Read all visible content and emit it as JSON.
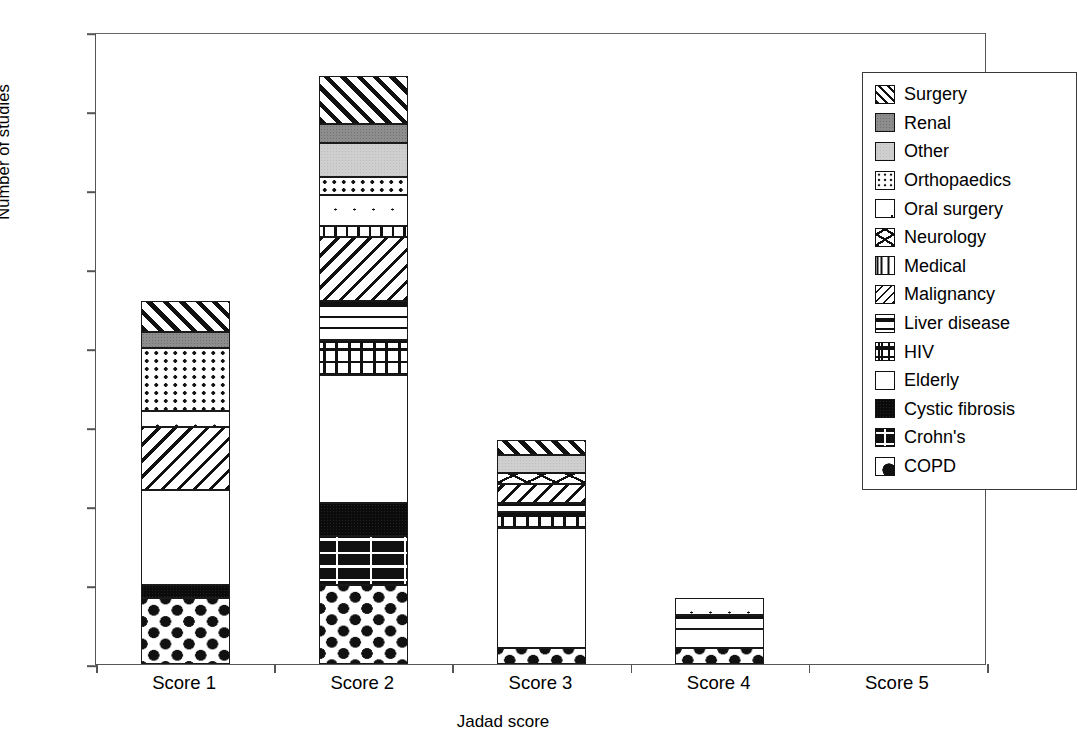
{
  "chart_data": {
    "type": "bar",
    "subtype": "stacked-bar",
    "title": "",
    "xlabel": "Jadad score",
    "ylabel": "Number of studies",
    "categories": [
      "Score 1",
      "Score 2",
      "Score 3",
      "Score 4",
      "Score 5"
    ],
    "ylim": [
      0,
      40
    ],
    "yticks": [
      0,
      5,
      10,
      15,
      20,
      25,
      30,
      35,
      40
    ],
    "grid": false,
    "legend_position": "top-right (inside plot area)",
    "series": [
      {
        "name": "COPD",
        "values": [
          4.2,
          5.0,
          1.0,
          1.0,
          0
        ]
      },
      {
        "name": "Crohn's",
        "values": [
          0,
          3.1,
          0,
          0,
          0
        ]
      },
      {
        "name": "Cystic fibrosis",
        "values": [
          0.8,
          2.1,
          0,
          0,
          0
        ]
      },
      {
        "name": "Elderly",
        "values": [
          6.0,
          8.1,
          7.6,
          1.2,
          0
        ]
      },
      {
        "name": "HIV",
        "values": [
          0,
          2.2,
          1.0,
          0,
          0
        ]
      },
      {
        "name": "Liver disease",
        "values": [
          0,
          2.5,
          0.6,
          0.9,
          0
        ]
      },
      {
        "name": "Malignancy",
        "values": [
          4.0,
          4.0,
          1.2,
          0,
          0
        ]
      },
      {
        "name": "Medical",
        "values": [
          0,
          0.7,
          0,
          0,
          0
        ]
      },
      {
        "name": "Neurology",
        "values": [
          0,
          0,
          0.7,
          0,
          0
        ]
      },
      {
        "name": "Oral surgery",
        "values": [
          1.0,
          2.0,
          0,
          1.1,
          0
        ]
      },
      {
        "name": "Orthopaedics",
        "values": [
          4.0,
          1.1,
          0,
          0,
          0
        ]
      },
      {
        "name": "Other",
        "values": [
          0,
          2.2,
          1.1,
          0,
          0
        ]
      },
      {
        "name": "Renal",
        "values": [
          1.0,
          1.2,
          0,
          0,
          0
        ]
      },
      {
        "name": "Surgery",
        "values": [
          2.0,
          3.0,
          1.0,
          0,
          0
        ]
      }
    ],
    "totals": [
      23.0,
      37.2,
      14.2,
      4.2,
      0
    ],
    "stacks": [
      {
        "category": "Score 1",
        "total": "23",
        "segments": [
          {
            "name": "COPD",
            "from": 0,
            "to": 4.2
          },
          {
            "name": "Cystic fibrosis",
            "from": 4.2,
            "to": 5.0
          },
          {
            "name": "Elderly",
            "from": 5.0,
            "to": 11.0
          },
          {
            "name": "Malignancy",
            "from": 11.0,
            "to": 15.0
          },
          {
            "name": "Oral surgery",
            "from": 15.0,
            "to": 16.0
          },
          {
            "name": "Orthopaedics",
            "from": 16.0,
            "to": 20.0
          },
          {
            "name": "Renal",
            "from": 20.0,
            "to": 21.0
          },
          {
            "name": "Surgery",
            "from": 21.0,
            "to": 23.0
          }
        ]
      },
      {
        "category": "Score 2",
        "total": "37",
        "segments": [
          {
            "name": "COPD",
            "from": 0,
            "to": 5.0
          },
          {
            "name": "Crohn's",
            "from": 5.0,
            "to": 8.1
          },
          {
            "name": "Cystic fibrosis",
            "from": 8.1,
            "to": 10.2
          },
          {
            "name": "Elderly",
            "from": 10.2,
            "to": 18.3
          },
          {
            "name": "HIV",
            "from": 18.3,
            "to": 20.5
          },
          {
            "name": "Liver disease",
            "from": 20.5,
            "to": 23.0
          },
          {
            "name": "Malignancy",
            "from": 23.0,
            "to": 27.0
          },
          {
            "name": "Medical",
            "from": 27.0,
            "to": 27.7
          },
          {
            "name": "Oral surgery",
            "from": 27.7,
            "to": 29.7
          },
          {
            "name": "Orthopaedics",
            "from": 29.7,
            "to": 30.8
          },
          {
            "name": "Other",
            "from": 30.8,
            "to": 33.0
          },
          {
            "name": "Renal",
            "from": 33.0,
            "to": 34.2
          },
          {
            "name": "Surgery",
            "from": 34.2,
            "to": 37.2
          }
        ]
      },
      {
        "category": "Score 3",
        "total": "14",
        "segments": [
          {
            "name": "COPD",
            "from": 0,
            "to": 1.0
          },
          {
            "name": "Elderly",
            "from": 1.0,
            "to": 8.6
          },
          {
            "name": "HIV",
            "from": 8.6,
            "to": 9.6
          },
          {
            "name": "Liver disease",
            "from": 9.6,
            "to": 10.2
          },
          {
            "name": "Malignancy",
            "from": 10.2,
            "to": 11.4
          },
          {
            "name": "Neurology",
            "from": 11.4,
            "to": 12.1
          },
          {
            "name": "Other",
            "from": 12.1,
            "to": 13.2
          },
          {
            "name": "Surgery",
            "from": 13.2,
            "to": 14.2
          }
        ]
      },
      {
        "category": "Score 4",
        "total": "4",
        "segments": [
          {
            "name": "COPD",
            "from": 0,
            "to": 1.0
          },
          {
            "name": "Elderly",
            "from": 1.0,
            "to": 2.2
          },
          {
            "name": "Liver disease",
            "from": 2.2,
            "to": 3.1
          },
          {
            "name": "Oral surgery",
            "from": 3.1,
            "to": 4.2
          }
        ]
      },
      {
        "category": "Score 5",
        "total": "0",
        "segments": []
      }
    ]
  },
  "axes": {
    "y_title": "Number of studies",
    "x_title": "Jadad score",
    "y_tick_labels": [
      "40",
      "35",
      "30",
      "25",
      "20",
      "15",
      "10",
      "5",
      "0"
    ],
    "x_tick_labels": [
      "Score 1",
      "Score 2",
      "Score 3",
      "Score 4",
      "Score 5"
    ]
  },
  "legend": {
    "items": [
      {
        "label": "Surgery",
        "pattern": "diagonal-hatch-forward-thick",
        "css": "p-surgery"
      },
      {
        "label": "Renal",
        "pattern": "solid-dark-gray",
        "css": "p-renal"
      },
      {
        "label": "Other",
        "pattern": "solid-light-gray",
        "css": "p-other"
      },
      {
        "label": "Orthopaedics",
        "pattern": "dense-dots",
        "css": "p-orthopaedics"
      },
      {
        "label": "Oral surgery",
        "pattern": "sparse-dots",
        "css": "p-oral"
      },
      {
        "label": "Neurology",
        "pattern": "crossed-diagonal-bowtie",
        "css": "p-neurology"
      },
      {
        "label": "Medical",
        "pattern": "vertical-lines",
        "css": "p-medical"
      },
      {
        "label": "Malignancy",
        "pattern": "diagonal-hatch-back-thin",
        "css": "p-malignancy"
      },
      {
        "label": "Liver disease",
        "pattern": "horizontal-lines",
        "css": "p-liver"
      },
      {
        "label": "HIV",
        "pattern": "grid-crosshatch",
        "css": "p-hiv"
      },
      {
        "label": "Elderly",
        "pattern": "empty-white",
        "css": "p-elderly"
      },
      {
        "label": "Cystic fibrosis",
        "pattern": "solid-black",
        "css": "p-cystic"
      },
      {
        "label": "Crohn's",
        "pattern": "brick",
        "css": "p-crohns"
      },
      {
        "label": "COPD",
        "pattern": "black-diamonds",
        "css": "p-copd"
      }
    ]
  },
  "colors": {
    "renal_gray": "#8d8d8d",
    "other_gray": "#cfcfcf",
    "ink": "#111111",
    "axis": "#555555",
    "background": "#ffffff"
  }
}
